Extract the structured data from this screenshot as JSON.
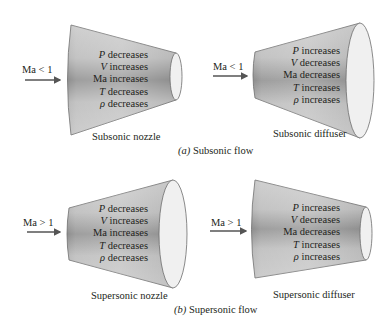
{
  "figure": {
    "panels": [
      {
        "id": "a",
        "caption_letter": "(a)",
        "caption_text": " Subsonic flow",
        "devices": [
          {
            "name": "Subsonic nozzle",
            "inlet": "Ma < 1",
            "properties": [
              {
                "symbol": "P",
                "change": " decreases"
              },
              {
                "symbol": "V",
                "change": " increases"
              },
              {
                "symbol": "Ma",
                "change": " increases"
              },
              {
                "symbol": "T",
                "change": " decreases"
              },
              {
                "symbol": "ρ",
                "change": " decreases"
              }
            ]
          },
          {
            "name": "Subsonic diffuser",
            "inlet": "Ma < 1",
            "properties": [
              {
                "symbol": "P",
                "change": " increases"
              },
              {
                "symbol": "V",
                "change": " decreases"
              },
              {
                "symbol": "Ma",
                "change": " decreases"
              },
              {
                "symbol": "T",
                "change": " increases"
              },
              {
                "symbol": "ρ",
                "change": " increases"
              }
            ]
          }
        ]
      },
      {
        "id": "b",
        "caption_letter": "(b)",
        "caption_text": " Supersonic flow",
        "devices": [
          {
            "name": "Supersonic nozzle",
            "inlet": "Ma > 1",
            "properties": [
              {
                "symbol": "P",
                "change": " decreases"
              },
              {
                "symbol": "V",
                "change": " increases"
              },
              {
                "symbol": "Ma",
                "change": " increases"
              },
              {
                "symbol": "T",
                "change": " decreases"
              },
              {
                "symbol": "ρ",
                "change": " decreases"
              }
            ]
          },
          {
            "name": "Supersonic diffuser",
            "inlet": "Ma > 1",
            "properties": [
              {
                "symbol": "P",
                "change": " increases"
              },
              {
                "symbol": "V",
                "change": " decreases"
              },
              {
                "symbol": "Ma",
                "change": " decreases"
              },
              {
                "symbol": "T",
                "change": " increases"
              },
              {
                "symbol": "ρ",
                "change": " increases"
              }
            ]
          }
        ]
      }
    ]
  },
  "colors": {
    "duct_light": "#d9d9d9",
    "duct_mid": "#b5b5b5",
    "duct_dark": "#8a8a8a",
    "outlet_face": "#f2f2f2",
    "outline": "#6d6d6d",
    "arrow": "#555555",
    "text": "#231f20"
  }
}
